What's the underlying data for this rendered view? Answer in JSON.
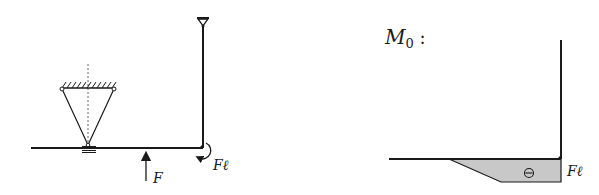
{
  "figure": {
    "left_panel": {
      "description": "Structural system: L-shaped frame with pinned top support, cable-triangle suspension on beam, applied force and moment",
      "labels": {
        "force": "F",
        "moment": "Fℓ"
      }
    },
    "right_panel": {
      "title": "M",
      "title_subscript": "0",
      "title_suffix": " :",
      "labels": {
        "sign": "⊖",
        "moment_value": "Fℓ"
      }
    },
    "colors": {
      "line": "#1a1a1a",
      "fill": "#c8c8c8",
      "background": "#ffffff"
    }
  }
}
